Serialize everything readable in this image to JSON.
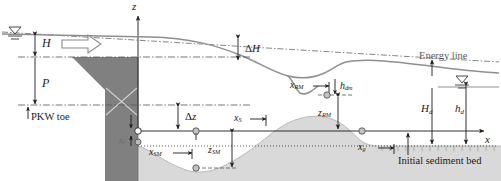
{
  "figure": {
    "type": "schematic-diagram",
    "axes": {
      "vertical_axis_label": "z",
      "horizontal_axis_label": "x",
      "origin_x": 138,
      "origin_y": 131
    },
    "colors": {
      "structure_fill": "#808080",
      "structure_stroke": "#6e6e6e",
      "sediment_fill": "#d9d9d9",
      "water_surface": "#8c8c8c",
      "dash_line": "#555555",
      "text": "#1a1a1a",
      "marker_fill": "#ffffff",
      "marker_stroke": "#333333"
    },
    "labels": [
      {
        "name": "z-axis-label",
        "text": "z",
        "italic": true,
        "x": 134,
        "y": 2
      },
      {
        "name": "x-axis-label",
        "text": "x",
        "italic": true,
        "x": 485,
        "y": 142
      },
      {
        "name": "head-H-label",
        "text": "H",
        "italic": true,
        "x": 40,
        "y": 38
      },
      {
        "name": "weir-height-P-label",
        "text": "P",
        "italic": true,
        "x": 40,
        "y": 78
      },
      {
        "name": "pkw-toe-label",
        "text": "PKW toe",
        "italic": false,
        "x": 20,
        "y": 113
      },
      {
        "name": "delta-H-label",
        "text": "ΔH",
        "italic": true,
        "x": 244,
        "y": 46
      },
      {
        "name": "delta-z-label",
        "text": "Δz",
        "italic": true,
        "x": 163,
        "y": 112
      },
      {
        "name": "z0-label",
        "text": "z₀",
        "italic": true,
        "x": 122,
        "y": 137
      },
      {
        "name": "x-s-label",
        "text": "xS",
        "italic": true,
        "x": 233,
        "y": 114
      },
      {
        "name": "x-sm-label",
        "text": "xSM",
        "italic": true,
        "x": 148,
        "y": 148
      },
      {
        "name": "z-sm-label",
        "text": "zSM",
        "italic": true,
        "x": 207,
        "y": 146
      },
      {
        "name": "x-rm-label",
        "text": "xRM",
        "italic": true,
        "x": 292,
        "y": 82
      },
      {
        "name": "h-dm-label",
        "text": "hdm",
        "italic": true,
        "x": 341,
        "y": 83
      },
      {
        "name": "z-rm-label",
        "text": "zRM",
        "italic": true,
        "x": 320,
        "y": 109
      },
      {
        "name": "x-g-label",
        "text": "xg",
        "italic": true,
        "x": 357,
        "y": 143
      },
      {
        "name": "energy-line-label",
        "text": "Energy line",
        "italic": false,
        "x": 424,
        "y": 54
      },
      {
        "name": "initial-sediment-bed-label",
        "text": "Initial sediment bed",
        "italic": false,
        "x": 398,
        "y": 158
      },
      {
        "name": "H-d-label",
        "text": "Hd",
        "italic": true,
        "x": 424,
        "y": 104
      },
      {
        "name": "h-d-label",
        "text": "hd",
        "italic": true,
        "x": 458,
        "y": 104
      }
    ],
    "label_text": {
      "z_axis": "z",
      "x_axis": "x",
      "H": "H",
      "P": "P",
      "pkw_toe": "PKW toe",
      "delta_H_main": "Δ",
      "delta_H_sub": "H",
      "delta_z_main": "Δ",
      "delta_z_sub": "z",
      "z0_main": "z",
      "z0_sub": "0",
      "xS_main": "x",
      "xS_sub": "S",
      "xSM_main": "x",
      "xSM_sub": "SM",
      "zSM_main": "z",
      "zSM_sub": "SM",
      "xRM_main": "x",
      "xRM_sub": "RM",
      "hdm_main": "h",
      "hdm_sub": "dm",
      "zRM_main": "z",
      "zRM_sub": "RM",
      "xg_main": "x",
      "xg_sub": "g",
      "energy_line": "Energy line",
      "initial_sediment_bed": "Initial sediment bed",
      "Hd_main": "H",
      "Hd_sub": "d",
      "hd_main": "h",
      "hd_sub": "d"
    },
    "features": [
      {
        "name": "upstream-water-surface-symbol",
        "description": "free surface triangle symbol upstream"
      },
      {
        "name": "downstream-water-surface-symbol",
        "description": "free surface triangle symbol downstream"
      },
      {
        "name": "flow-direction-arrow",
        "description": "hollow block arrow indicating flow direction"
      },
      {
        "name": "pkw-structure",
        "description": "grey piano key weir with trapezoidal crest and rectangular base with X cross"
      },
      {
        "name": "scour-hole-profile",
        "description": "grey sediment bed with scour hole and downstream ridge/dune"
      },
      {
        "name": "energy-line",
        "description": "horizontal dash-dot energy grade line"
      },
      {
        "name": "water-surface-profile",
        "description": "curved free-surface profile from upstream to downstream"
      }
    ]
  }
}
